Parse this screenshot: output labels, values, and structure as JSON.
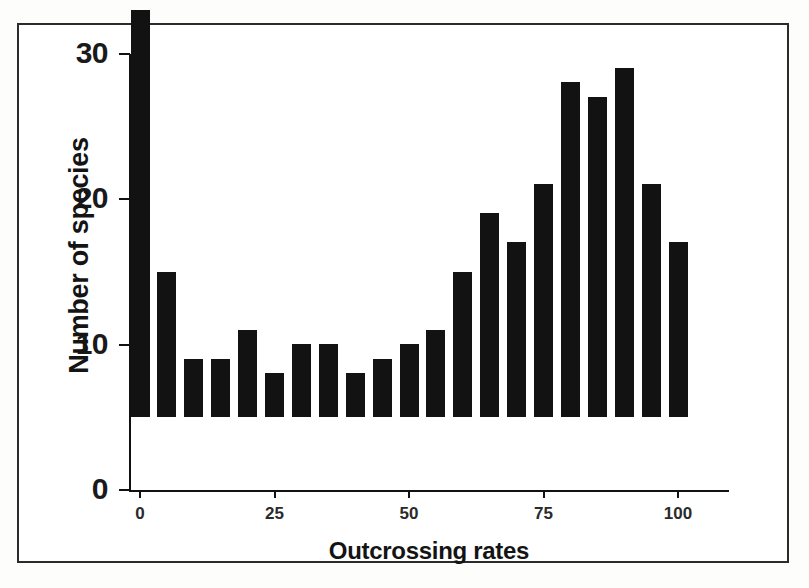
{
  "figure": {
    "background_color": "#ffffff",
    "frame_color": "#2b2b2b",
    "bar_color": "#121212"
  },
  "chart_data": {
    "type": "bar",
    "title": "",
    "subtitle": "",
    "xlabel": "Outcrossing rates",
    "ylabel": "Number of species",
    "xlim": [
      -3,
      108
    ],
    "ylim": [
      0,
      30
    ],
    "grid": false,
    "legend": null,
    "x_ticks": [
      0,
      25,
      50,
      75,
      100
    ],
    "x_tick_labels": [
      "0",
      "25",
      "50",
      "75",
      "100"
    ],
    "y_ticks": [
      0,
      10,
      20,
      30
    ],
    "y_tick_labels": [
      "0",
      "10",
      "20",
      "30"
    ],
    "bin_width": 5,
    "categories": [
      0,
      5,
      10,
      15,
      20,
      25,
      30,
      35,
      40,
      45,
      50,
      55,
      60,
      65,
      70,
      75,
      80,
      85,
      90,
      95,
      100
    ],
    "values": [
      28,
      10,
      4,
      4,
      6,
      3,
      5,
      5,
      3,
      4,
      5,
      6,
      10,
      14,
      12,
      16,
      23,
      22,
      24,
      16,
      12
    ],
    "series": [
      {
        "name": "Number of species",
        "values": [
          28,
          10,
          4,
          4,
          6,
          3,
          5,
          5,
          3,
          4,
          5,
          6,
          10,
          14,
          12,
          16,
          23,
          22,
          24,
          16,
          12
        ]
      }
    ],
    "annotations": []
  }
}
